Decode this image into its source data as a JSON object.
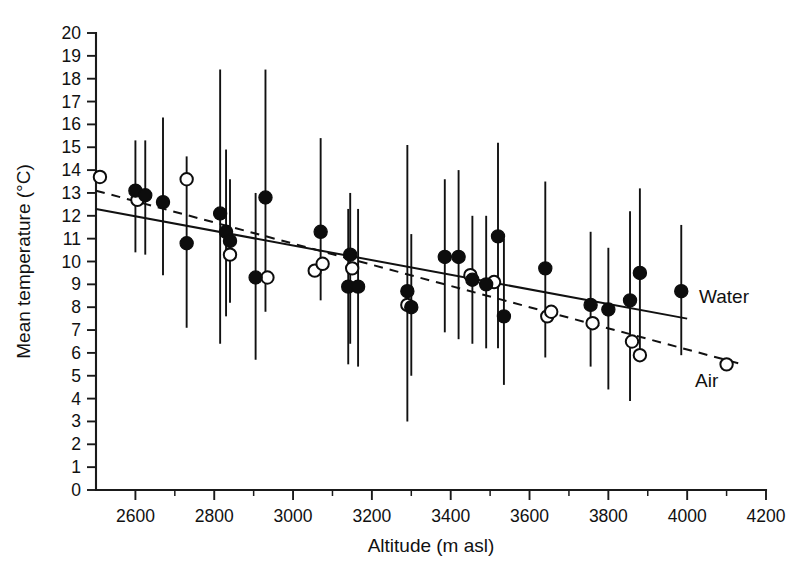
{
  "chart_data": {
    "type": "scatter",
    "title": "",
    "xlabel": "Altitude (m asl)",
    "ylabel": "Mean temperature (°C)",
    "xlim": [
      2500,
      4200
    ],
    "ylim": [
      0,
      20
    ],
    "xticks": [
      2600,
      2800,
      3000,
      3200,
      3400,
      3600,
      3800,
      4000,
      4200
    ],
    "xtick_labels": [
      "2600",
      "2800",
      "3000",
      "3200",
      "3400",
      "3600",
      "3800",
      "4000",
      "4200"
    ],
    "x_minor_step": 100,
    "yticks": [
      0,
      1,
      2,
      3,
      4,
      5,
      6,
      7,
      8,
      9,
      10,
      11,
      12,
      13,
      14,
      15,
      16,
      17,
      18,
      19,
      20
    ],
    "ytick_labels": [
      "0",
      "1",
      "2",
      "3",
      "4",
      "5",
      "6",
      "7",
      "8",
      "9",
      "10",
      "11",
      "12",
      "13",
      "14",
      "15",
      "16",
      "17",
      "18",
      "19",
      "20"
    ],
    "grid": false,
    "legend_position": "inline-right",
    "marker_colors": {
      "water_fill": "#0d0d0d",
      "air_fill": "#ffffff",
      "stroke": "#0d0d0d"
    },
    "series": [
      {
        "name": "Water",
        "marker": "filled-circle",
        "line_style": "solid",
        "points": [
          {
            "x": 2600,
            "y": 13.1,
            "err_low": 10.4,
            "err_high": 15.3
          },
          {
            "x": 2625,
            "y": 12.9,
            "err_low": 10.3,
            "err_high": 15.3
          },
          {
            "x": 2670,
            "y": 12.6,
            "err_low": 9.4,
            "err_high": 16.3
          },
          {
            "x": 2730,
            "y": 10.8,
            "err_low": 7.1,
            "err_high": 14.6
          },
          {
            "x": 2815,
            "y": 12.1,
            "err_low": 6.4,
            "err_high": 18.4
          },
          {
            "x": 2830,
            "y": 11.3,
            "err_low": 7.6,
            "err_high": 14.9
          },
          {
            "x": 2840,
            "y": 10.9,
            "err_low": 8.2,
            "err_high": 13.6
          },
          {
            "x": 2930,
            "y": 12.8,
            "err_low": 7.8,
            "err_high": 18.4
          },
          {
            "x": 2905,
            "y": 9.3,
            "err_low": 5.7,
            "err_high": 13.0
          },
          {
            "x": 3070,
            "y": 11.3,
            "err_low": 8.3,
            "err_high": 15.4
          },
          {
            "x": 3145,
            "y": 10.3,
            "err_low": 6.4,
            "err_high": 13.0
          },
          {
            "x": 3140,
            "y": 8.9,
            "err_low": 5.5,
            "err_high": 12.3
          },
          {
            "x": 3165,
            "y": 8.9,
            "err_low": 5.4,
            "err_high": 12.3
          },
          {
            "x": 3290,
            "y": 8.7,
            "err_low": 3.0,
            "err_high": 15.1
          },
          {
            "x": 3300,
            "y": 8.0,
            "err_low": 5.0,
            "err_high": 11.2
          },
          {
            "x": 3385,
            "y": 10.2,
            "err_low": 6.9,
            "err_high": 13.6
          },
          {
            "x": 3420,
            "y": 10.2,
            "err_low": 6.6,
            "err_high": 14.0
          },
          {
            "x": 3455,
            "y": 9.2,
            "err_low": 6.4,
            "err_high": 12.0
          },
          {
            "x": 3490,
            "y": 9.0,
            "err_low": 6.2,
            "err_high": 12.0
          },
          {
            "x": 3520,
            "y": 11.1,
            "err_low": 6.2,
            "err_high": 15.2
          },
          {
            "x": 3535,
            "y": 7.6,
            "err_low": 4.6,
            "err_high": 11.0
          },
          {
            "x": 3640,
            "y": 9.7,
            "err_low": 5.8,
            "err_high": 13.5
          },
          {
            "x": 3755,
            "y": 8.1,
            "err_low": 5.4,
            "err_high": 11.3
          },
          {
            "x": 3800,
            "y": 7.9,
            "err_low": 4.4,
            "err_high": 10.6
          },
          {
            "x": 3855,
            "y": 8.3,
            "err_low": 3.9,
            "err_high": 12.2
          },
          {
            "x": 3880,
            "y": 9.5,
            "err_low": 5.9,
            "err_high": 13.2
          },
          {
            "x": 3985,
            "y": 8.7,
            "err_low": 5.9,
            "err_high": 11.6
          }
        ],
        "fit_line": {
          "x1": 2500,
          "y1": 12.3,
          "x2": 4000,
          "y2": 7.5
        }
      },
      {
        "name": "Air",
        "marker": "open-circle",
        "line_style": "dashed",
        "points": [
          {
            "x": 2510,
            "y": 13.7
          },
          {
            "x": 2605,
            "y": 12.7
          },
          {
            "x": 2730,
            "y": 13.6
          },
          {
            "x": 2840,
            "y": 10.3
          },
          {
            "x": 2935,
            "y": 9.3
          },
          {
            "x": 3055,
            "y": 9.6
          },
          {
            "x": 3075,
            "y": 9.9
          },
          {
            "x": 3150,
            "y": 9.7
          },
          {
            "x": 3290,
            "y": 8.1
          },
          {
            "x": 3450,
            "y": 9.4
          },
          {
            "x": 3510,
            "y": 9.1
          },
          {
            "x": 3645,
            "y": 7.6
          },
          {
            "x": 3655,
            "y": 7.8
          },
          {
            "x": 3760,
            "y": 7.3
          },
          {
            "x": 3860,
            "y": 6.5
          },
          {
            "x": 3880,
            "y": 5.9
          },
          {
            "x": 4100,
            "y": 5.5
          }
        ],
        "fit_line": {
          "x1": 2500,
          "y1": 13.1,
          "x2": 4140,
          "y2": 5.5
        }
      }
    ],
    "annotations": [
      {
        "text": "Water",
        "x": 4030,
        "y": 8.2
      },
      {
        "text": "Air",
        "x": 4020,
        "y": 4.5
      }
    ]
  }
}
